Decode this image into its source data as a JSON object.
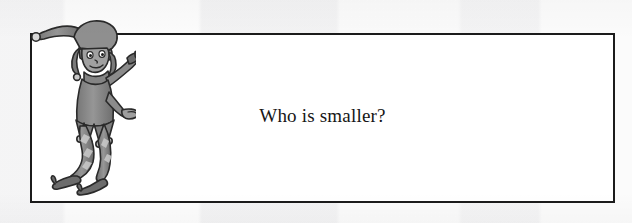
{
  "page": {
    "background_color": "#fbfbfb",
    "scan_band_colors": [
      "#f4f4f5",
      "#fcfcfc",
      "#f2f2f3",
      "#fafafa",
      "#f3f3f4",
      "#fbfbfb"
    ]
  },
  "question_box": {
    "border_color": "#1b1b1b",
    "fill_color": "#ffffff",
    "question_text": "Who is smaller?"
  },
  "illustration": {
    "name": "jester-elf-character",
    "description": "Grey cartoon jester/elf in a floppy belled cap, tunic with jagged belled hem, striped leggings and curled-toe shoes, one arm raised pointing right",
    "body_color": "#8e8e8e",
    "shade_color": "#6f6f6f",
    "highlight_color": "#bdbdbd",
    "outline_color": "#2a2a2a",
    "face_color": "#9a9a9a"
  }
}
